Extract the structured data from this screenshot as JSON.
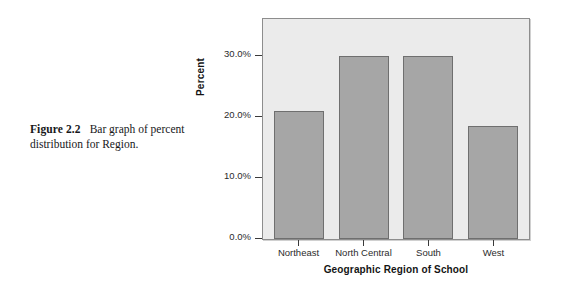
{
  "caption": {
    "figure_label": "Figure 2.2",
    "text": "Bar graph of percent distribution for Region."
  },
  "chart_data": {
    "type": "bar",
    "title": "",
    "categories": [
      "Northeast",
      "North Central",
      "South",
      "West"
    ],
    "values": [
      21.0,
      30.0,
      30.0,
      18.5
    ],
    "value_labels": [
      "21.0%",
      "30.0%",
      "30.0%",
      "18.5%"
    ],
    "xlabel": "Geographic Region of School",
    "ylabel": "Percent",
    "ylim": [
      0,
      36
    ],
    "yticks": [
      0,
      10,
      20,
      30
    ],
    "ytick_labels": [
      "0.0%",
      "10.0%",
      "20.0%",
      "30.0%"
    ],
    "grid": false,
    "legend": false,
    "colors": {
      "bar_fill": "#a6a6a6",
      "bar_edge": "#6f6f6f",
      "plot_background": "#ebebeb",
      "frame": "#8d8d8d",
      "text": "#1a1a1a"
    }
  }
}
